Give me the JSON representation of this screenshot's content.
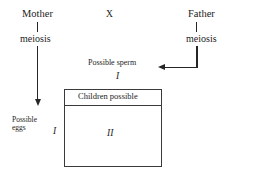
{
  "diagram": {
    "parents": {
      "mother_label": "Mother",
      "father_label": "Father",
      "cross_symbol": "X"
    },
    "processes": {
      "mother_meiosis": "meiosis",
      "father_meiosis": "meiosis"
    },
    "gametes": {
      "sperm_label": "Possible sperm",
      "sperm_allele": "I",
      "eggs_label": "Possible\neggs",
      "eggs_allele": "I"
    },
    "offspring_box": {
      "header": "Children possible",
      "genotype": "II"
    },
    "colors": {
      "ink": "#262626",
      "box_border": "#3a3a3a",
      "background": "#ffffff"
    }
  }
}
